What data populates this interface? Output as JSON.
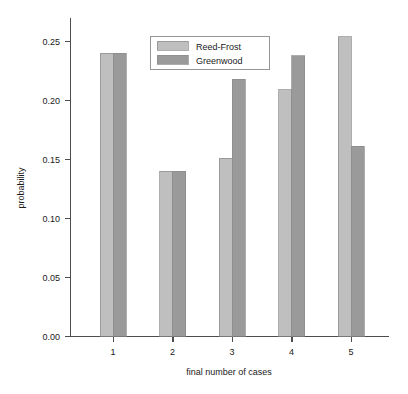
{
  "chart_data": {
    "type": "bar",
    "title": "",
    "subtitle": "",
    "xlabel": "final number of cases",
    "ylabel": "probability",
    "categories": [
      "1",
      "2",
      "3",
      "4",
      "5"
    ],
    "series": [
      {
        "name": "Reed-Frost",
        "color": "#bfbfbf",
        "values": [
          0.24,
          0.14,
          0.151,
          0.209,
          0.254
        ]
      },
      {
        "name": "Greenwood",
        "color": "#9a9a9a",
        "values": [
          0.24,
          0.14,
          0.218,
          0.238,
          0.161
        ]
      }
    ],
    "ylim": [
      0.0,
      0.26
    ],
    "xlim": [
      0.5,
      5.8
    ],
    "yticks": [
      0.0,
      0.05,
      0.1,
      0.15,
      0.2,
      0.25
    ],
    "ytick_labels": [
      "0.00",
      "0.05",
      "0.10",
      "0.15",
      "0.20",
      "0.25"
    ],
    "xtick_labels": [
      "1",
      "2",
      "3",
      "4",
      "5"
    ],
    "grid": false,
    "legend_position": "top-center",
    "legend_entries": [
      "Reed-Frost",
      "Greenwood"
    ],
    "annotations": []
  },
  "figure": {
    "background_color": "#ffffff",
    "axis_color": "#4d4d4d",
    "text_color": "#1a1a1a"
  }
}
